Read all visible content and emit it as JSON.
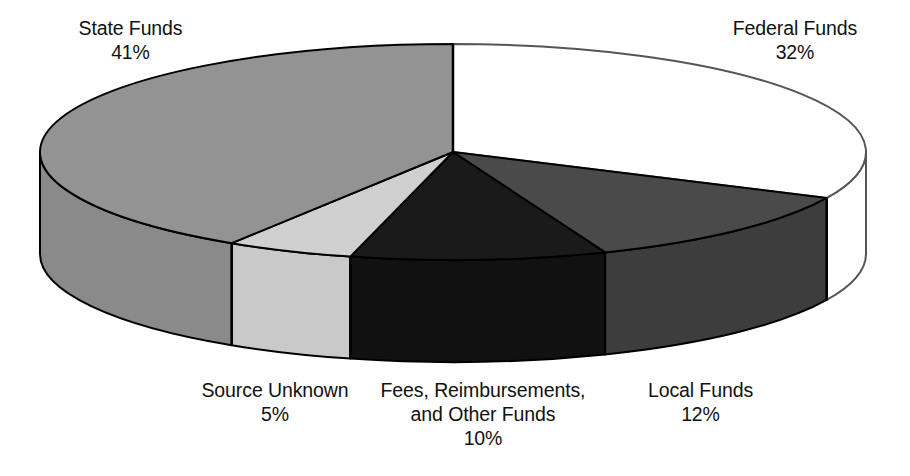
{
  "chart_data": {
    "type": "pie",
    "title": "",
    "subtitle": "",
    "xlabel": "",
    "ylabel": "",
    "style": "3d-exploded-pie",
    "legend_position": "none",
    "grid": false,
    "unit": "%",
    "start_angle_deg": 0,
    "direction": "clockwise",
    "categories": [
      "Federal Funds",
      "Local Funds",
      "Fees, Reimbursements, and Other Funds",
      "Source Unknown",
      "State Funds"
    ],
    "values": [
      32,
      12,
      10,
      5,
      41
    ],
    "slices": [
      {
        "label": "Federal Funds",
        "label_line1": "Federal Funds",
        "label_line2": "",
        "value": 32,
        "percent_text": "32%",
        "color": "#ffffff",
        "side_color": "#ffffff",
        "stroke": "#555555"
      },
      {
        "label": "Local Funds",
        "label_line1": "Local Funds",
        "label_line2": "",
        "value": 12,
        "percent_text": "12%",
        "color": "#4a4a4a",
        "side_color": "#3d3d3d",
        "stroke": "#000000"
      },
      {
        "label": "Fees, Reimbursements, and Other Funds",
        "label_line1": "Fees, Reimbursements,",
        "label_line2": "and Other Funds",
        "value": 10,
        "percent_text": "10%",
        "color": "#1a1a1a",
        "side_color": "#111111",
        "stroke": "#000000"
      },
      {
        "label": "Source Unknown",
        "label_line1": "Source Unknown",
        "label_line2": "",
        "value": 5,
        "percent_text": "5%",
        "color": "#d0d0d0",
        "side_color": "#c9c9c9",
        "stroke": "#000000"
      },
      {
        "label": "State Funds",
        "label_line1": "State Funds",
        "label_line2": "",
        "value": 41,
        "percent_text": "41%",
        "color": "#939393",
        "side_color": "#8a8a8a",
        "stroke": "#000000"
      }
    ]
  },
  "labels": {
    "state": {
      "name": "State Funds",
      "percent": "41%"
    },
    "federal": {
      "name": "Federal Funds",
      "percent": "32%"
    },
    "source_unknown": {
      "name": "Source Unknown",
      "percent": "5%"
    },
    "fees": {
      "name_line1": "Fees, Reimbursements,",
      "name_line2": "and Other Funds",
      "percent": "10%"
    },
    "local": {
      "name": "Local Funds",
      "percent": "12%"
    }
  },
  "colors": {
    "background": "#ffffff",
    "text": "#111111",
    "state_funds": "#8a8a8a",
    "federal_funds": "#ffffff",
    "local_funds": "#3d3d3d",
    "fees_other": "#1a1a1a",
    "source_unknown": "#c9c9c9",
    "outline": "#000000"
  }
}
